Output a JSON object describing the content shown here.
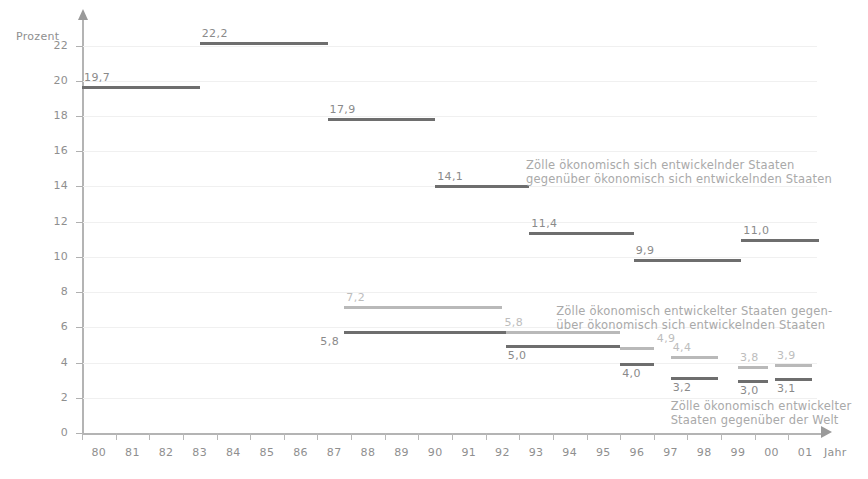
{
  "figure": {
    "top_cut_text": "",
    "y_axis_title": "Prozent",
    "x_axis_title": "Jahr"
  },
  "chart_data": {
    "type": "bar",
    "xlabel": "Jahr",
    "ylabel": "Prozent",
    "xlim": [
      80,
      102
    ],
    "ylim": [
      0,
      23
    ],
    "grid": true,
    "legend_position": "inside-right",
    "y_ticks": [
      "0",
      "2",
      "4",
      "6",
      "8",
      "10",
      "12",
      "14",
      "16",
      "18",
      "20",
      "22"
    ],
    "y_tick_values": [
      0,
      2,
      4,
      6,
      8,
      10,
      12,
      14,
      16,
      18,
      20,
      22
    ],
    "x_ticks": [
      "80",
      "81",
      "82",
      "83",
      "84",
      "85",
      "86",
      "87",
      "88",
      "89",
      "90",
      "91",
      "92",
      "93",
      "94",
      "95",
      "96",
      "97",
      "98",
      "99",
      "00",
      "01"
    ],
    "x_tick_values": [
      80,
      81,
      82,
      83,
      84,
      85,
      86,
      87,
      88,
      89,
      90,
      91,
      92,
      93,
      94,
      95,
      96,
      97,
      98,
      99,
      100,
      101
    ],
    "series": [
      {
        "name": "Zölle ökonomisch sich entwickelnder Staaten gegenüber ökonomisch sich entwickelnden Staaten",
        "color": "#6e6e6e",
        "style": "dark",
        "segments": [
          {
            "label": "19,7",
            "value": 19.7,
            "x_start": 80.0,
            "x_end": 83.5,
            "label_side": "left"
          },
          {
            "label": "22,2",
            "value": 22.2,
            "x_start": 83.5,
            "x_end": 87.3,
            "label_side": "left"
          },
          {
            "label": "17,9",
            "value": 17.9,
            "x_start": 87.3,
            "x_end": 90.5,
            "label_side": "left"
          },
          {
            "label": "14,1",
            "value": 14.1,
            "x_start": 90.5,
            "x_end": 93.3,
            "label_side": "left"
          },
          {
            "label": "11,4",
            "value": 11.4,
            "x_start": 93.3,
            "x_end": 96.4,
            "label_side": "left"
          },
          {
            "label": "9,9",
            "value": 9.9,
            "x_start": 96.4,
            "x_end": 99.6,
            "label_side": "left"
          },
          {
            "label": "11,0",
            "value": 11.0,
            "x_start": 99.6,
            "x_end": 101.9,
            "label_side": "left"
          }
        ]
      },
      {
        "name": "Zölle ökonomisch entwickelter Staaten gegenüber ökonomisch sich entwickelnden Staaten",
        "color": "#b9b9b9",
        "style": "light",
        "segments": [
          {
            "label": "7,2",
            "value": 7.2,
            "x_start": 87.8,
            "x_end": 92.5,
            "label_side": "left"
          },
          {
            "label": "5,8",
            "value": 5.8,
            "x_start": 92.5,
            "x_end": 96.0,
            "label_side": "left"
          },
          {
            "label": "4,9",
            "value": 4.9,
            "x_start": 96.0,
            "x_end": 97.0,
            "label_side": "right"
          },
          {
            "label": "4,4",
            "value": 4.4,
            "x_start": 97.5,
            "x_end": 98.9,
            "label_side": "left"
          },
          {
            "label": "3,8",
            "value": 3.8,
            "x_start": 99.5,
            "x_end": 100.4,
            "label_side": "left"
          },
          {
            "label": "3,9",
            "value": 3.9,
            "x_start": 100.6,
            "x_end": 101.7,
            "label_side": "left"
          }
        ]
      },
      {
        "name": "Zölle ökonomisch entwickelter Staaten gegenüber der Welt",
        "color": "#6e6e6e",
        "style": "dark",
        "segments": [
          {
            "label": "5,8",
            "value": 5.8,
            "x_start": 87.8,
            "x_end": 92.6,
            "label_side": "left-below"
          },
          {
            "label": "5,0",
            "value": 5.0,
            "x_start": 92.6,
            "x_end": 96.0,
            "label_side": "below"
          },
          {
            "label": "4,0",
            "value": 4.0,
            "x_start": 96.0,
            "x_end": 97.0,
            "label_side": "below"
          },
          {
            "label": "3,2",
            "value": 3.2,
            "x_start": 97.5,
            "x_end": 98.9,
            "label_side": "below"
          },
          {
            "label": "3,0",
            "value": 3.0,
            "x_start": 99.5,
            "x_end": 100.4,
            "label_side": "below"
          },
          {
            "label": "3,1",
            "value": 3.1,
            "x_start": 100.6,
            "x_end": 101.7,
            "label_side": "below"
          }
        ]
      }
    ],
    "annotations": [
      {
        "id": "annot-developing-vs-developing",
        "line1": "Zölle ökonomisch sich entwickelnder Staaten",
        "line2": "gegenüber ökonomisch sich entwickelnden Staaten"
      },
      {
        "id": "annot-advanced-vs-developing",
        "line1": "Zölle ökonomisch entwickelter Staaten gegen-",
        "line2": "über ökonomisch sich entwickelnden Staaten"
      },
      {
        "id": "annot-advanced-vs-world",
        "line1": "Zölle ökonomisch entwickelter",
        "line2": "Staaten gegenüber der Welt"
      }
    ]
  }
}
